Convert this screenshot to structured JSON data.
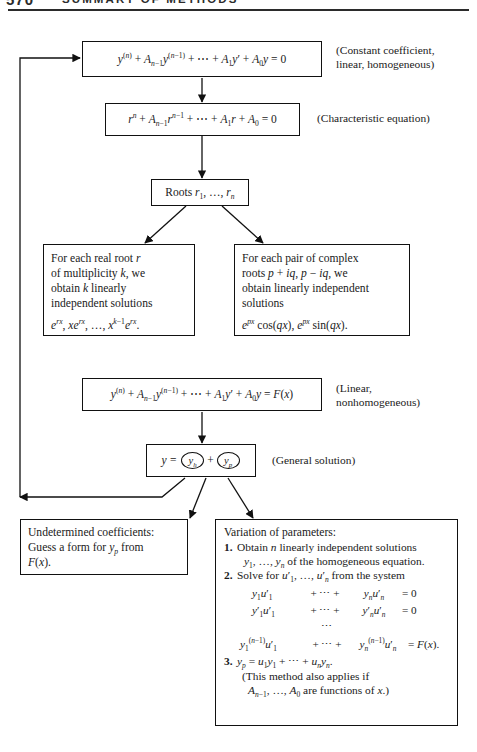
{
  "page": {
    "folio": "570",
    "running_head": "SUMMARY OF METHODS"
  },
  "diagram": {
    "nodes": {
      "homogeneous_equation": {
        "equation": "y⁽ⁿ⁾ + Aₙ₋₁y⁽ⁿ⁻¹⁾ + ⋯ + A₁y′ + A₀y = 0",
        "label": "(Constant coefficient,\nlinear, homogeneous)"
      },
      "characteristic_equation": {
        "equation": "rⁿ + Aₙ₋₁rⁿ⁻¹ + ⋯ + A₁r + A₀ = 0",
        "label": "(Characteristic equation)"
      },
      "roots": {
        "text": "Roots r₁, …, rₙ"
      },
      "real_roots": {
        "line1": "For each real root r",
        "line2": "of multiplicity k, we",
        "line3": "obtain k linearly",
        "line4": "independent solutions",
        "line5": "eʳˣ, xeʳˣ, …, xᵏ⁻¹eʳˣ."
      },
      "complex_roots": {
        "line1": "For each pair of complex",
        "line2": "roots p + iq, p − iq, we",
        "line3": "obtain linearly independent",
        "line4": "solutions",
        "line5": "eᵖˣ cos(qx), eᵖˣ sin(qx)."
      },
      "nonhomogeneous_equation": {
        "equation": "y⁽ⁿ⁾ + Aₙ₋₁y⁽ⁿ⁻¹⁾ + ⋯ + A₁y′ + A₀y = F(x)",
        "label": "(Linear,\nnonhomogeneous)"
      },
      "general_solution": {
        "equation": "y = (y_h) + (y_p)",
        "lhs": "y =",
        "term_h": "yₕ",
        "plus": "+",
        "term_p": "yₚ",
        "label": "(General solution)"
      },
      "undetermined_coefficients": {
        "line1": "Undetermined coefficients:",
        "line2": "Guess a form for yₚ from",
        "line3": "F(x)."
      },
      "variation_of_parameters": {
        "title": "Variation of parameters:",
        "step1_num": "1.",
        "step1_line1": "Obtain n linearly independent solutions",
        "step1_line2": "y₁, …, yₙ of the homogeneous equation.",
        "step2_num": "2.",
        "step2_line1": "Solve for u′₁, …, u′ₙ from the system",
        "system": [
          {
            "a": "y₁u′₁",
            "b": "+ ⋯ +",
            "c": "yₙu′ₙ",
            "d": "= 0"
          },
          {
            "a": "y′₁u′₁",
            "b": "+ ⋯ +",
            "c": "y′ₙu′ₙ",
            "d": "= 0"
          },
          {
            "a": "",
            "b": "⋯",
            "c": "",
            "d": ""
          },
          {
            "a": "y₁⁽ⁿ⁻¹⁾u′₁",
            "b": "+ ⋯ +",
            "c": "yₙ⁽ⁿ⁻¹⁾u′ₙ",
            "d": "= F(x)."
          }
        ],
        "step3_num": "3.",
        "step3_line1": "yₚ = u₁y₁ + ⋯ + uₙyₙ.",
        "step3_line2": "(This method also applies if",
        "step3_line3": "Aₙ₋₁, …, A₀ are functions of x.)"
      }
    },
    "colors": {
      "ink": "#111111",
      "paper": "#ffffff",
      "rule": "#2b2b2b"
    }
  }
}
